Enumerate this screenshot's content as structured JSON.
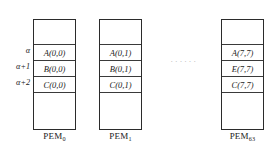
{
  "diagram": {
    "address_labels": [
      "α",
      "α+1",
      "α+2"
    ],
    "ellipsis": "······",
    "columns": [
      {
        "caption_base": "PEM",
        "caption_sub": "0",
        "cells": [
          "A(0,0)",
          "B(0,0)",
          "C(0,0)"
        ]
      },
      {
        "caption_base": "PEM",
        "caption_sub": "1",
        "cells": [
          "A(0,1)",
          "B(0,1)",
          "C(0,1)"
        ]
      },
      {
        "caption_base": "PEM",
        "caption_sub": "63",
        "cells": [
          "A(7,7)",
          "E(7,7)",
          "C(7,7)"
        ]
      }
    ]
  }
}
